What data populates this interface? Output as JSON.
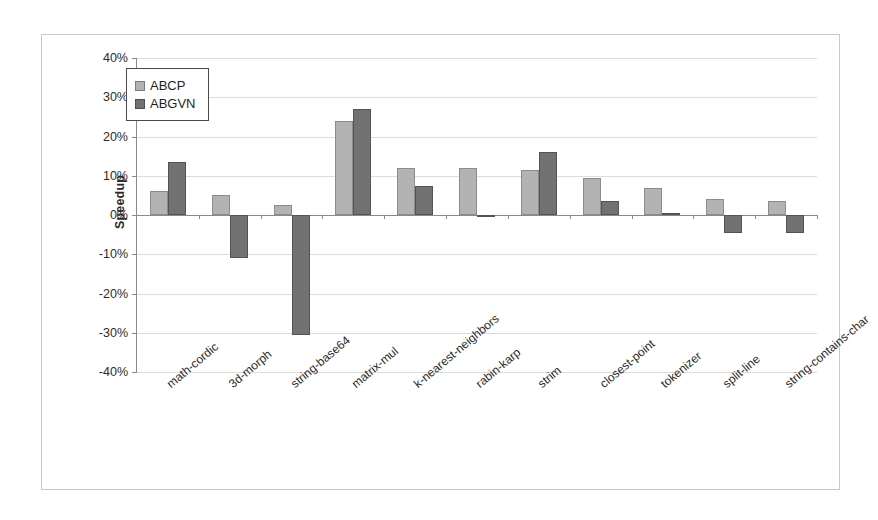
{
  "chart_data": {
    "type": "bar",
    "title": "",
    "xlabel": "",
    "ylabel": "Speedup",
    "ylim": [
      -40,
      40
    ],
    "ytick_step": 10,
    "ytick_labels": [
      "40%",
      "30%",
      "20%",
      "10%",
      "0%",
      "-10%",
      "-20%",
      "-30%",
      "-40%"
    ],
    "ytick_values": [
      40,
      30,
      20,
      10,
      0,
      -10,
      -20,
      -30,
      -40
    ],
    "grid": true,
    "legend_position": "upper-left-inside",
    "value_unit": "percent",
    "categories": [
      "math-cordic",
      "3d-morph",
      "string-base64",
      "matrix-mul",
      "k-nearest-neighbors",
      "rabin-karp",
      "strim",
      "closest-point",
      "tokenizer",
      "split-line",
      "string-contains-char"
    ],
    "series": [
      {
        "name": "ABCP",
        "color": "#b3b3b3",
        "values": [
          6,
          5,
          2.5,
          24,
          12,
          12,
          11.5,
          9.5,
          7,
          4,
          3.5
        ]
      },
      {
        "name": "ABGVN",
        "color": "#727272",
        "values": [
          13.5,
          -11,
          -30.5,
          27,
          7.5,
          -0.5,
          16,
          3.5,
          0.5,
          -4.5,
          -4.5
        ]
      }
    ]
  },
  "legend": {
    "items": [
      {
        "label": "ABCP"
      },
      {
        "label": "ABGVN"
      }
    ]
  }
}
